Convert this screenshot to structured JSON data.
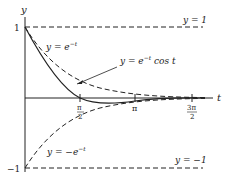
{
  "diagram": {
    "axes": {
      "x_label": "t",
      "y_label": "y",
      "y_ticks": [
        {
          "value": 1,
          "label": "1"
        },
        {
          "value": -1,
          "label": "−1"
        }
      ],
      "x_ticks": [
        {
          "value": "pi/2",
          "num": "π",
          "den": "2"
        },
        {
          "value": "pi",
          "label": "π"
        },
        {
          "value": "3pi/2",
          "num": "3π",
          "den": "2"
        }
      ]
    },
    "curves": [
      {
        "id": "upper-envelope",
        "label": "y = e",
        "sup": "−t",
        "style": "solid-then-dashed"
      },
      {
        "id": "damped-cosine",
        "label": "y = e",
        "sup": "−t",
        "suffix": " cos t",
        "style": "solid"
      },
      {
        "id": "lower-envelope",
        "label": "y = −e",
        "sup": "−t",
        "style": "dashed"
      }
    ],
    "asymptotes": [
      {
        "label": "y = 1",
        "y": 1,
        "style": "dashed"
      },
      {
        "label": "y = −1",
        "y": -1,
        "style": "dashed"
      }
    ],
    "colors": {
      "stroke": "#222222",
      "text": "#222222",
      "background": "#ffffff"
    }
  }
}
